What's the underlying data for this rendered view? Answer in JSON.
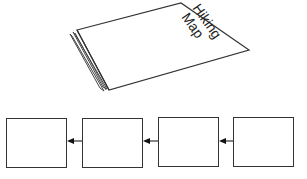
{
  "illustration": {
    "object": "folded-map",
    "title_line1": "Hiking",
    "title_line2": "Map"
  },
  "flow": {
    "boxes": [
      {
        "id": 1,
        "label": ""
      },
      {
        "id": 2,
        "label": ""
      },
      {
        "id": 3,
        "label": ""
      },
      {
        "id": 4,
        "label": ""
      }
    ],
    "arrow_direction": "right-to-left"
  }
}
